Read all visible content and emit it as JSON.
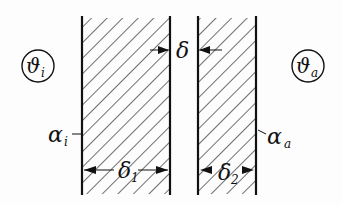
{
  "diagram": {
    "type": "two-layer wall with air gap (heat transfer)",
    "labels": {
      "inner_temp": "ϑ",
      "inner_temp_sub": "i",
      "outer_temp": "ϑ",
      "outer_temp_sub": "a",
      "inner_coeff": "α",
      "inner_coeff_sub": "i",
      "outer_coeff": "α",
      "outer_coeff_sub": "a",
      "gap": "δ",
      "layer1": "δ",
      "layer1_sub": "1",
      "layer2": "δ",
      "layer2_sub": "2"
    },
    "colors": {
      "line": "#111111",
      "background": "#fdfdfd"
    }
  }
}
